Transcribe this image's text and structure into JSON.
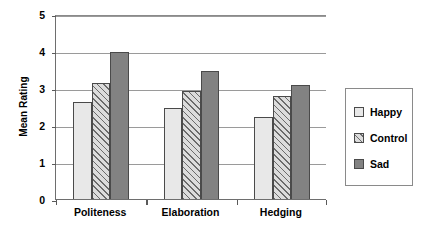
{
  "chart_data": {
    "type": "bar",
    "title": "",
    "subtitle": "",
    "xlabel": "",
    "ylabel": "Mean Rating",
    "categories": [
      "Politeness",
      "Elaboration",
      "Hedging"
    ],
    "series": [
      {
        "name": "Happy",
        "values": [
          2.65,
          2.5,
          2.25
        ],
        "color": "#e8e8e8",
        "pattern": "solid"
      },
      {
        "name": "Control",
        "values": [
          3.15,
          2.95,
          2.8
        ],
        "color": "#dcdcdc",
        "pattern": "diagonal-hatch"
      },
      {
        "name": "Sad",
        "values": [
          4.0,
          3.48,
          3.12
        ],
        "color": "#828282",
        "pattern": "solid"
      }
    ],
    "ylim": [
      0,
      5
    ],
    "yticks": [
      "0",
      "1",
      "2",
      "3",
      "4",
      "5"
    ],
    "grid": true,
    "grid_axis": "y",
    "legend_position": "right",
    "legend_boxed": true
  },
  "legend": {
    "items": [
      {
        "label": "Happy"
      },
      {
        "label": "Control"
      },
      {
        "label": "Sad"
      }
    ]
  }
}
